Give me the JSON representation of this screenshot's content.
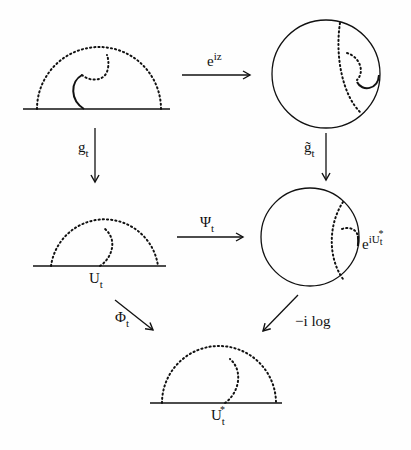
{
  "figure": {
    "panels": {
      "top_left": {
        "description": "upper half-plane with slit curve"
      },
      "top_right": {
        "description": "unit disk image"
      },
      "mid_left": {
        "description": "half-plane after g_t",
        "point_label": {
          "base": "U",
          "sub": "t"
        }
      },
      "mid_right": {
        "description": "disk after g-tilde_t",
        "point_label": {
          "base": "e",
          "sup": "iU",
          "sup_sub": "t",
          "sup_star": "*"
        }
      },
      "bottom": {
        "description": "half-plane after -i log",
        "point_label": {
          "base": "U",
          "sub": "t",
          "star": "*"
        }
      }
    },
    "arrows": {
      "top": {
        "base": "e",
        "sup": "iz"
      },
      "left_down": {
        "base": "g",
        "sub": "t"
      },
      "right_down": {
        "base": "g̃",
        "sub": "t"
      },
      "middle": {
        "base": "Ψ",
        "sub": "t"
      },
      "diag_left": {
        "base": "Φ",
        "sub": "t"
      },
      "diag_right": {
        "text": "−i log"
      }
    },
    "colors": {
      "stroke": "#111111",
      "background": "#fefefe"
    }
  }
}
